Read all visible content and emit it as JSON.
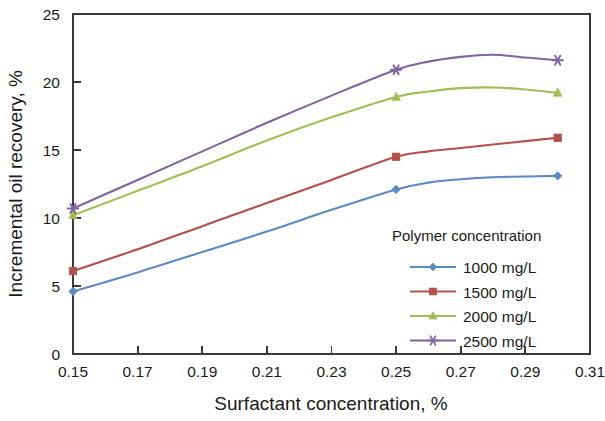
{
  "chart_data": {
    "type": "line",
    "title": "",
    "xlabel": "Surfactant concentration, %",
    "ylabel": "Incremental oil recovery, %",
    "xlim": [
      0.15,
      0.31
    ],
    "ylim": [
      0,
      25
    ],
    "xticks": [
      "0.15",
      "0.17",
      "0.19",
      "0.21",
      "0.23",
      "0.25",
      "0.27",
      "0.29",
      "0.31"
    ],
    "xtick_values": [
      0.15,
      0.17,
      0.19,
      0.21,
      0.23,
      0.25,
      0.27,
      0.29,
      0.31
    ],
    "yticks": [
      "0",
      "5",
      "10",
      "15",
      "20",
      "25"
    ],
    "ytick_values": [
      0,
      5,
      10,
      15,
      20,
      25
    ],
    "grid": false,
    "legend_position": "inside-lower-right",
    "legend_title": "Polymer concentration",
    "series": [
      {
        "name": "1000 mg/L",
        "color": "#5b89c4",
        "marker": "diamond",
        "x": [
          0.15,
          0.17,
          0.19,
          0.21,
          0.23,
          0.25,
          0.26,
          0.27,
          0.28,
          0.29,
          0.3
        ],
        "values": [
          4.6,
          6.0,
          7.5,
          9.0,
          10.6,
          12.1,
          12.6,
          12.85,
          13.0,
          13.05,
          13.1
        ]
      },
      {
        "name": "1500 mg/L",
        "color": "#b4504a",
        "marker": "square",
        "x": [
          0.15,
          0.17,
          0.19,
          0.21,
          0.23,
          0.25,
          0.26,
          0.27,
          0.28,
          0.29,
          0.3
        ],
        "values": [
          6.1,
          7.7,
          9.4,
          11.1,
          12.8,
          14.5,
          14.9,
          15.15,
          15.4,
          15.65,
          15.9
        ]
      },
      {
        "name": "2000 mg/L",
        "color": "#9fbe55",
        "marker": "triangle",
        "x": [
          0.15,
          0.17,
          0.19,
          0.21,
          0.23,
          0.25,
          0.26,
          0.27,
          0.28,
          0.29,
          0.3
        ],
        "values": [
          10.2,
          12.0,
          13.8,
          15.7,
          17.4,
          18.9,
          19.3,
          19.55,
          19.6,
          19.45,
          19.2
        ]
      },
      {
        "name": "2500 mg/L",
        "color": "#7f64a0",
        "marker": "star",
        "x": [
          0.15,
          0.17,
          0.19,
          0.21,
          0.23,
          0.25,
          0.26,
          0.27,
          0.28,
          0.29,
          0.3
        ],
        "values": [
          10.7,
          12.8,
          14.9,
          17.0,
          19.0,
          20.9,
          21.5,
          21.85,
          22.0,
          21.8,
          21.6
        ]
      }
    ]
  }
}
